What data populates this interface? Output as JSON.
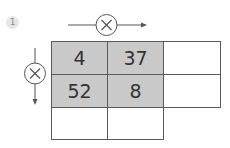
{
  "problem": {
    "number": "1",
    "operator_top": "×",
    "operator_left": "×"
  },
  "grid": {
    "rows": [
      [
        {
          "value": "4",
          "shaded": true
        },
        {
          "value": "37",
          "shaded": true
        },
        {
          "value": "",
          "shaded": false
        }
      ],
      [
        {
          "value": "52",
          "shaded": true
        },
        {
          "value": "8",
          "shaded": true
        },
        {
          "value": "",
          "shaded": false
        }
      ],
      [
        {
          "value": "",
          "shaded": false
        },
        {
          "value": "",
          "shaded": false
        },
        {
          "value": null,
          "shaded": false
        }
      ]
    ]
  },
  "colors": {
    "shaded_cell": "#c9c9c9",
    "border": "#5a5a5a",
    "text": "#333333",
    "badge_bg": "#e6e6e6"
  }
}
